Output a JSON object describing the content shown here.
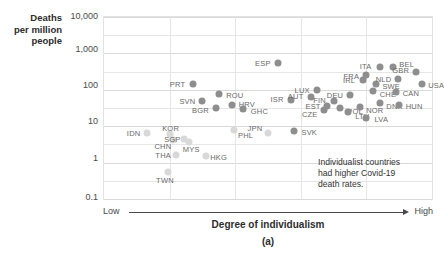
{
  "axes": {
    "y_title_lines": [
      "Deaths",
      "per million",
      "people"
    ],
    "y_ticks": [
      "10,000",
      "1,000",
      "100",
      "10",
      "1",
      "0.1"
    ],
    "x_title": "Degree of individualism",
    "x_low": "Low",
    "x_high": "High",
    "panel_label": "(a)"
  },
  "annotation": {
    "line1": "Individualist countries",
    "line2": "had higher Covid-19",
    "line3": "death rates."
  },
  "chart_data": {
    "type": "scatter",
    "title": "",
    "xlabel": "Degree of individualism",
    "ylabel": "Deaths per million people",
    "yscale": "log",
    "ylim": [
      0.1,
      10000
    ],
    "ytick_labels": [
      "10,000",
      "1,000",
      "100",
      "10",
      "1",
      "0.1"
    ],
    "xlim": [
      0,
      100
    ],
    "xtick_labels": [
      "Low",
      "High"
    ],
    "grid": true,
    "legend": "none",
    "annotations": [
      "Individualist countries had higher Covid-19 death rates."
    ],
    "points": [
      {
        "code": "PRT",
        "x": 27.0,
        "y": 140,
        "marker": "dark",
        "lx": -15,
        "ly": 0
      },
      {
        "code": "ROU",
        "x": 35.0,
        "y": 75,
        "marker": "dark",
        "lx": 16,
        "ly": 1
      },
      {
        "code": "SVN",
        "x": 30.0,
        "y": 48,
        "marker": "dark",
        "lx": -15,
        "ly": 0
      },
      {
        "code": "HRV",
        "x": 39.0,
        "y": 38,
        "marker": "dark",
        "lx": 15,
        "ly": -1
      },
      {
        "code": "BGR",
        "x": 34.0,
        "y": 31,
        "marker": "dark",
        "lx": -15,
        "ly": 2
      },
      {
        "code": "GHC",
        "x": 42.5,
        "y": 29,
        "marker": "dark",
        "lx": 16,
        "ly": 2
      },
      {
        "code": "ESP",
        "x": 53.0,
        "y": 560,
        "marker": "dark",
        "lx": -15,
        "ly": 0
      },
      {
        "code": "ISR",
        "x": 57.0,
        "y": 52,
        "marker": "dark",
        "lx": -14,
        "ly": -1
      },
      {
        "code": "LUX",
        "x": 65.0,
        "y": 100,
        "marker": "dark",
        "lx": -15,
        "ly": 0
      },
      {
        "code": "AUT",
        "x": 63.0,
        "y": 62,
        "marker": "dark",
        "lx": -15,
        "ly": -1
      },
      {
        "code": "FIN",
        "x": 70.0,
        "y": 50,
        "marker": "dark",
        "lx": -14,
        "ly": -1
      },
      {
        "code": "EST",
        "x": 68.0,
        "y": 36,
        "marker": "dark",
        "lx": -14,
        "ly": 0
      },
      {
        "code": "CZE",
        "x": 67.0,
        "y": 27,
        "marker": "dark",
        "lx": -14,
        "ly": 4
      },
      {
        "code": "POL",
        "x": 72.0,
        "y": 31,
        "marker": "dark",
        "lx": 15,
        "ly": 3
      },
      {
        "code": "LTU",
        "x": 74.5,
        "y": 25,
        "marker": "dark",
        "lx": 14,
        "ly": 4
      },
      {
        "code": "DEU",
        "x": 75.0,
        "y": 70,
        "marker": "dark",
        "lx": -15,
        "ly": 0
      },
      {
        "code": "IRL",
        "x": 79.0,
        "y": 185,
        "marker": "dark",
        "lx": -14,
        "ly": 0
      },
      {
        "code": "FRA",
        "x": 80.0,
        "y": 250,
        "marker": "dark",
        "lx": -15,
        "ly": 1
      },
      {
        "code": "ITA",
        "x": 84.0,
        "y": 420,
        "marker": "dark",
        "lx": -14,
        "ly": -1
      },
      {
        "code": "SWE",
        "x": 83.0,
        "y": 140,
        "marker": "dark",
        "lx": 15,
        "ly": 2
      },
      {
        "code": "CHE",
        "x": 82.0,
        "y": 92,
        "marker": "dark",
        "lx": 15,
        "ly": 3
      },
      {
        "code": "BEL",
        "x": 88.0,
        "y": 430,
        "marker": "dark",
        "lx": 14,
        "ly": -3
      },
      {
        "code": "NLD",
        "x": 89.5,
        "y": 200,
        "marker": "dark",
        "lx": -14,
        "ly": 0
      },
      {
        "code": "GBR",
        "x": 95.0,
        "y": 310,
        "marker": "dark",
        "lx": -15,
        "ly": -2
      },
      {
        "code": "USA",
        "x": 97.0,
        "y": 145,
        "marker": "dark",
        "lx": 14,
        "ly": 1
      },
      {
        "code": "CAN",
        "x": 89.0,
        "y": 88,
        "marker": "dark",
        "lx": 15,
        "ly": 1
      },
      {
        "code": "DNK",
        "x": 84.0,
        "y": 44,
        "marker": "dark",
        "lx": 15,
        "ly": 3
      },
      {
        "code": "HUN",
        "x": 90.0,
        "y": 38,
        "marker": "dark",
        "lx": 15,
        "ly": 1
      },
      {
        "code": "NOR",
        "x": 78.0,
        "y": 33,
        "marker": "dark",
        "lx": 15,
        "ly": 3
      },
      {
        "code": "LVA",
        "x": 80.0,
        "y": 17,
        "marker": "dark",
        "lx": 15,
        "ly": 1
      },
      {
        "code": "SVK",
        "x": 58.0,
        "y": 7.5,
        "marker": "dark",
        "lx": 15,
        "ly": 1
      },
      {
        "code": "JPN",
        "x": 50.0,
        "y": 6.5,
        "marker": "light",
        "lx": -13,
        "ly": -5
      },
      {
        "code": "PHL",
        "x": 39.5,
        "y": 8.0,
        "marker": "light",
        "lx": 12,
        "ly": 5
      },
      {
        "code": "IDN",
        "x": 13.0,
        "y": 6.5,
        "marker": "light",
        "lx": -13,
        "ly": 0
      },
      {
        "code": "KOR",
        "x": 20.0,
        "y": 6.0,
        "marker": "light",
        "lx": 1,
        "ly": -6
      },
      {
        "code": "CHN",
        "x": 21.0,
        "y": 4.2,
        "marker": "light",
        "lx": -10,
        "ly": 6
      },
      {
        "code": "SGP",
        "x": 24.5,
        "y": 4.5,
        "marker": "light",
        "lx": -12,
        "ly": 0
      },
      {
        "code": "MYS",
        "x": 26.0,
        "y": 3.6,
        "marker": "light",
        "lx": 2,
        "ly": 7
      },
      {
        "code": "THA",
        "x": 22.0,
        "y": 1.6,
        "marker": "light",
        "lx": -13,
        "ly": 0
      },
      {
        "code": "HKG",
        "x": 31.0,
        "y": 1.5,
        "marker": "light",
        "lx": 13,
        "ly": 1
      },
      {
        "code": "TWN",
        "x": 19.5,
        "y": 0.55,
        "marker": "light",
        "lx": -3,
        "ly": 8
      }
    ]
  }
}
